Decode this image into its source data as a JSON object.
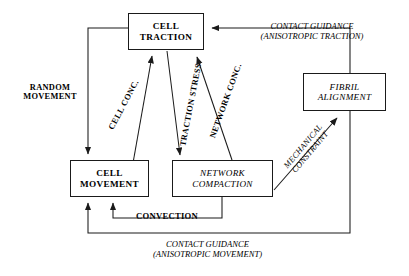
{
  "diagram": {
    "line_color": "#1a1a1a",
    "background_color": "#ffffff",
    "nodes": [
      {
        "id": "cell-traction",
        "label": "CELL\nTRACTION",
        "line1": "CELL",
        "line2": "TRACTION",
        "style": "bold-upright"
      },
      {
        "id": "fibril-alignment",
        "label": "FIBRIL\nALIGNMENT",
        "line1": "FIBRIL",
        "line2": "ALIGNMENT",
        "style": "italic-plain"
      },
      {
        "id": "cell-movement",
        "label": "CELL\nMOVEMENT",
        "line1": "CELL",
        "line2": "MOVEMENT",
        "style": "bold-upright"
      },
      {
        "id": "network-compaction",
        "label": "NETWORK\nCOMPACTION",
        "line1": "NETWORK",
        "line2": "COMPACTION",
        "style": "italic-plain"
      }
    ],
    "edge_labels": [
      {
        "id": "random-movement",
        "line1": "RANDOM",
        "line2": "MOVEMENT",
        "style": "bold-upright"
      },
      {
        "id": "contact-guidance-traction",
        "line1": "CONTACT GUIDANCE",
        "line2": "(ANISOTROPIC TRACTION)",
        "style": "italic-plain"
      },
      {
        "id": "contact-guidance-movement",
        "line1": "CONTACT GUIDANCE",
        "line2": "(ANISOTROPIC MOVEMENT)",
        "style": "italic-plain"
      },
      {
        "id": "convection",
        "line1": "CONVECTION",
        "line2": "",
        "style": "bold-upright"
      },
      {
        "id": "cell-conc",
        "line1": "CELL CONC.",
        "line2": "",
        "style": "bold-upright"
      },
      {
        "id": "traction-stress",
        "line1": "TRACTION STRESS",
        "line2": "",
        "style": "bold-upright"
      },
      {
        "id": "network-conc",
        "line1": "NETWORK CONC.",
        "line2": "",
        "style": "bold-upright"
      },
      {
        "id": "mechanical-constraint",
        "line1": "MECHANICAL",
        "line2": "CONSTRAINT",
        "style": "italic-plain"
      }
    ]
  }
}
